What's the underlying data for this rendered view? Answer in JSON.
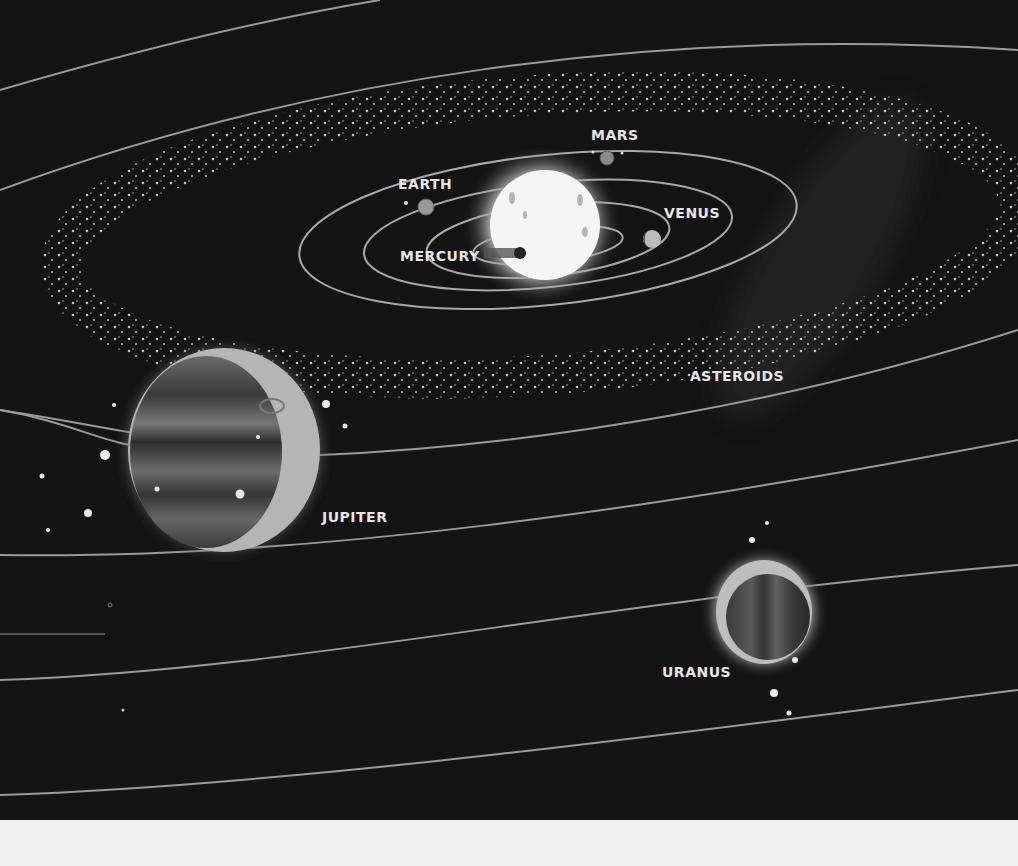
{
  "illustration": {
    "subject": "Solar system diagram",
    "background_color": "#141414",
    "labels": {
      "mars": "MARS",
      "earth": "EARTH",
      "venus": "VENUS",
      "mercury": "MERCURY",
      "asteroids": "ASTEROIDS",
      "jupiter": "JUPITER",
      "uranus": "URANUS"
    }
  },
  "footer": {
    "background_color": "#efefef"
  }
}
